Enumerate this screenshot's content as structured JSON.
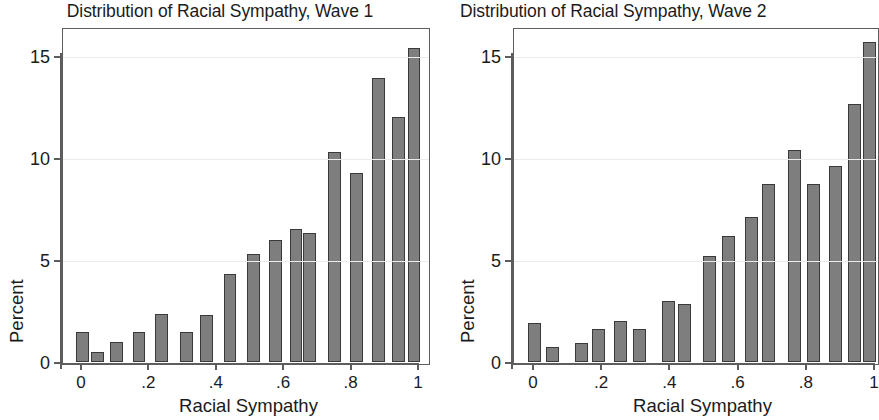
{
  "figure": {
    "background_color": "#ffffff",
    "bar_fill_color": "#7e7e7e",
    "bar_edge_color": "#3a3a3a",
    "axis_color": "#5d5d5d",
    "grid_color": "#eceaea",
    "text_color": "#1b1b1b"
  },
  "chart_data": [
    {
      "id": "wave1",
      "type": "bar",
      "title": "Distribution of Racial Sympathy, Wave 1",
      "xlabel": "Racial Sympathy",
      "ylabel": "Percent",
      "xlim": [
        -0.03,
        1.03
      ],
      "ylim": [
        0,
        16.6
      ],
      "xticks": [
        0,
        0.2,
        0.4,
        0.6,
        0.8,
        1
      ],
      "xticklabels": [
        "0",
        ".2",
        ".4",
        ".6",
        ".8",
        "1"
      ],
      "yticks": [
        0,
        5,
        10,
        15
      ],
      "yticklabels": [
        "0",
        "5",
        "10",
        "15"
      ],
      "grid": "horizontal",
      "legend": "none",
      "bar_width": 0.038,
      "x": [
        0.005,
        0.048,
        0.105,
        0.172,
        0.238,
        0.312,
        0.372,
        0.442,
        0.512,
        0.578,
        0.638,
        0.678,
        0.752,
        0.818,
        0.882,
        0.942,
        0.988
      ],
      "values": [
        1.45,
        0.5,
        1.0,
        1.45,
        2.35,
        1.45,
        2.3,
        4.3,
        5.3,
        6.0,
        6.5,
        6.3,
        10.3,
        9.25,
        13.9,
        12.0,
        15.4
      ]
    },
    {
      "id": "wave2",
      "type": "bar",
      "title": "Distribution of Racial Sympathy, Wave 2",
      "xlabel": "Racial Sympathy",
      "ylabel": "Percent",
      "xlim": [
        -0.03,
        1.03
      ],
      "ylim": [
        0,
        16.6
      ],
      "xticks": [
        0,
        0.2,
        0.4,
        0.6,
        0.8,
        1
      ],
      "xticklabels": [
        "0",
        ".2",
        ".4",
        ".6",
        ".8",
        "1"
      ],
      "yticks": [
        0,
        5,
        10,
        15
      ],
      "yticklabels": [
        "0",
        "5",
        "10",
        "15"
      ],
      "grid": "horizontal",
      "legend": "none",
      "bar_width": 0.038,
      "x": [
        0.005,
        0.058,
        0.142,
        0.192,
        0.258,
        0.312,
        0.398,
        0.445,
        0.518,
        0.572,
        0.642,
        0.692,
        0.768,
        0.822,
        0.888,
        0.942,
        0.988
      ],
      "values": [
        1.9,
        0.75,
        0.95,
        1.6,
        2.0,
        1.6,
        3.0,
        2.85,
        5.2,
        6.2,
        7.1,
        8.75,
        10.4,
        8.75,
        9.6,
        12.65,
        15.7
      ]
    }
  ]
}
